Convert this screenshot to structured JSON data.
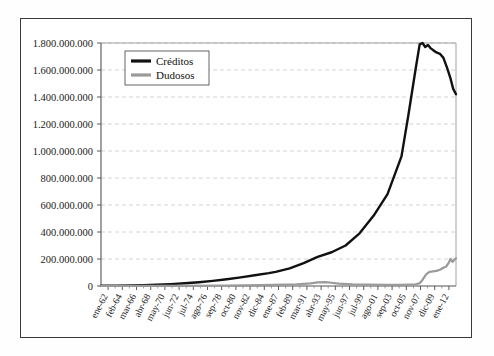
{
  "chart_data": {
    "type": "line",
    "title": "",
    "subtitle": "",
    "xlabel": "",
    "ylabel": "",
    "grid": true,
    "legend_position": "upper-left-inside",
    "ylim": [
      0,
      1800000000
    ],
    "ytick_labels": [
      "1.800.000.000",
      "1.600.000.000",
      "1.400.000.000",
      "1.200.000.000",
      "1.000.000.000",
      "800.000.000",
      "600.000.000",
      "400.000.000",
      "200.000.000",
      "0"
    ],
    "ytick_values": [
      1800000000,
      1600000000,
      1400000000,
      1200000000,
      1000000000,
      800000000,
      600000000,
      400000000,
      200000000,
      0
    ],
    "categories": [
      "ene-62",
      "feb-64",
      "mar-66",
      "abr-68",
      "may-70",
      "jun-72",
      "jul-74",
      "ago-76",
      "sep-78",
      "oct-80",
      "nov-82",
      "dic-84",
      "ene-87",
      "feb-89",
      "mar-91",
      "abr-93",
      "may-95",
      "jun-97",
      "jul-99",
      "ago-01",
      "sep-03",
      "oct-05",
      "nov-07",
      "dic-09",
      "ene-12"
    ],
    "x_range_years": [
      1962,
      2012.8
    ],
    "series": [
      {
        "name": "Créditos",
        "color": "#111111",
        "x": [
          1962,
          1964,
          1966,
          1968,
          1970,
          1972,
          1974,
          1976,
          1978,
          1980,
          1982,
          1984,
          1986,
          1987,
          1989,
          1991,
          1993,
          1995,
          1997,
          1999,
          2001,
          2003,
          2005,
          2006,
          2007,
          2007.6,
          2008,
          2008.4,
          2008.8,
          2009.2,
          2009.6,
          2010,
          2010.5,
          2011,
          2011.5,
          2012,
          2012.4,
          2012.8
        ],
        "values": [
          2000000,
          3000000,
          4500000,
          6500000,
          10000000,
          14000000,
          20000000,
          28000000,
          38000000,
          50000000,
          64000000,
          80000000,
          95000000,
          105000000,
          130000000,
          170000000,
          215000000,
          250000000,
          300000000,
          390000000,
          520000000,
          680000000,
          960000000,
          1270000000,
          1600000000,
          1790000000,
          1800000000,
          1770000000,
          1785000000,
          1760000000,
          1745000000,
          1730000000,
          1720000000,
          1690000000,
          1620000000,
          1540000000,
          1460000000,
          1420000000
        ]
      },
      {
        "name": "Dudosos",
        "color": "#9a9a9a",
        "x": [
          1962,
          1970,
          1980,
          1985,
          1990,
          1992,
          1993,
          1994,
          1995,
          1996,
          1998,
          2000,
          2003,
          2005,
          2006,
          2007,
          2007.6,
          2008,
          2008.5,
          2009,
          2009.5,
          2010,
          2010.5,
          2011,
          2011.4,
          2011.8,
          2012,
          2012.3,
          2012.5,
          2012.8
        ],
        "values": [
          500000,
          1000000,
          3000000,
          6000000,
          12000000,
          20000000,
          27000000,
          28000000,
          24000000,
          18000000,
          12000000,
          10000000,
          9000000,
          9000000,
          10000000,
          12000000,
          20000000,
          45000000,
          85000000,
          105000000,
          108000000,
          112000000,
          120000000,
          135000000,
          145000000,
          175000000,
          200000000,
          178000000,
          190000000,
          205000000
        ]
      }
    ],
    "legend": [
      {
        "label": "Créditos",
        "color": "#111111",
        "width": 2.6
      },
      {
        "label": "Dudosos",
        "color": "#9a9a9a",
        "width": 2.6
      }
    ]
  }
}
